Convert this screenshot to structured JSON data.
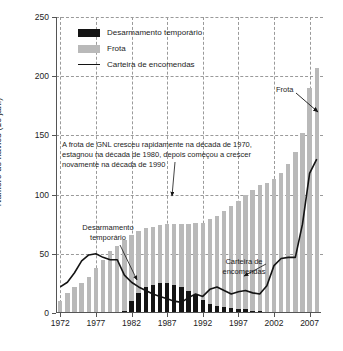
{
  "chart_data": {
    "type": "bar",
    "title": "",
    "xlabel": "",
    "ylabel": "Número de navios (1o jan.)",
    "xlim": [
      1971.4,
      2008.6
    ],
    "ylim": [
      0,
      250
    ],
    "yticks": [
      0,
      50,
      100,
      150,
      200,
      250
    ],
    "xticks": [
      1972,
      1977,
      1982,
      1987,
      1992,
      1997,
      2002,
      2007
    ],
    "grid": "horizontal dashed gridlines at every y tick; vertical dashed gridlines at every x tick",
    "legend_position": "top-left inside plot",
    "x": [
      1972,
      1973,
      1974,
      1975,
      1976,
      1977,
      1978,
      1979,
      1980,
      1981,
      1982,
      1983,
      1984,
      1985,
      1986,
      1987,
      1988,
      1989,
      1990,
      1991,
      1992,
      1993,
      1994,
      1995,
      1996,
      1997,
      1998,
      1999,
      2000,
      2001,
      2002,
      2003,
      2004,
      2005,
      2006,
      2007,
      2008
    ],
    "series": [
      {
        "name": "Frota",
        "type": "bar",
        "color": "#b9b9b9",
        "values": [
          10,
          17,
          22,
          25,
          30,
          38,
          45,
          52,
          57,
          62,
          66,
          69,
          72,
          73,
          74,
          75,
          75,
          75,
          75,
          76,
          76,
          79,
          82,
          86,
          90,
          95,
          100,
          104,
          108,
          110,
          113,
          118,
          126,
          136,
          152,
          190,
          207
        ]
      },
      {
        "name": "Desarmamento temporário",
        "type": "bar",
        "color": "#141414",
        "values": [
          0,
          0,
          0,
          0,
          0,
          0,
          0,
          0,
          0,
          2,
          10,
          17,
          22,
          24,
          25,
          25,
          24,
          22,
          19,
          15,
          11,
          8,
          6,
          5,
          4,
          3,
          3,
          2,
          2,
          1,
          0,
          0,
          0,
          0,
          0,
          0,
          0
        ]
      },
      {
        "name": "Carteira de encomendas",
        "type": "line",
        "color": "#141414",
        "values": [
          22,
          26,
          34,
          44,
          49,
          50,
          47,
          45,
          45,
          32,
          26,
          22,
          19,
          16,
          14,
          12,
          10,
          9,
          13,
          16,
          14,
          20,
          22,
          19,
          16,
          18,
          19,
          17,
          16,
          23,
          40,
          46,
          47,
          47,
          75,
          118,
          130
        ]
      }
    ],
    "annotations": [
      {
        "name": "main-note",
        "text": "A frota de GNL cresceu rapidamente na década de 1970, estagnou na década de 1980, depois começou a crescer novamente na década de 1990"
      },
      {
        "name": "layup-note",
        "text": "Desarmamento temporário"
      },
      {
        "name": "orderbook-note",
        "text": "Carteira de encomendas"
      },
      {
        "name": "fleet-note",
        "text": "Frota"
      }
    ]
  },
  "legend": {
    "items": [
      {
        "label": "Desarmamento temporário",
        "color": "#141414"
      },
      {
        "label": "Frota",
        "color": "#b9b9b9"
      },
      {
        "label": "Carteira de encomendas",
        "color": "#141414"
      }
    ]
  },
  "axes": {
    "y_label": "Número de navios (1o jan.)",
    "y_ticks": [
      "0",
      "50",
      "100",
      "150",
      "200",
      "250"
    ],
    "x_ticks": [
      "1972",
      "1977",
      "1982",
      "1987",
      "1992",
      "1997",
      "2002",
      "2007"
    ]
  },
  "annotations": {
    "main": "A frota de GNL cresceu rapidamente na década de 1970, estagnou na década de 1980, depois começou a crescer novamente na década de 1990",
    "layup": "Desarmamento temporário",
    "orderbook": "Carteira de encomendas",
    "fleet": "Frota"
  }
}
